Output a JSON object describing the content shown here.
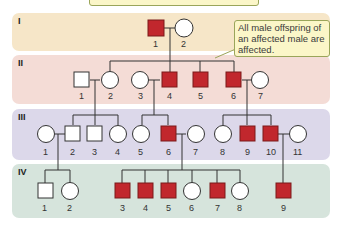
{
  "title_box": {
    "text": ""
  },
  "callout": {
    "text": "All male offspring of an affected male are affected."
  },
  "colors": {
    "affected": "#c1272d",
    "unaffected": "#ffffff",
    "gen1": "#f6e6c8",
    "gen2": "#f4dcd6",
    "gen3": "#dcd8ea",
    "gen4": "#d6e4dc"
  },
  "generations": [
    {
      "label": "I",
      "individuals": [
        {
          "id": "1",
          "sex": "male",
          "affected": true
        },
        {
          "id": "2",
          "sex": "female",
          "affected": false
        }
      ]
    },
    {
      "label": "II",
      "individuals": [
        {
          "id": "1",
          "sex": "male",
          "affected": false
        },
        {
          "id": "2",
          "sex": "female",
          "affected": false
        },
        {
          "id": "3",
          "sex": "female",
          "affected": false
        },
        {
          "id": "4",
          "sex": "male",
          "affected": true
        },
        {
          "id": "5",
          "sex": "male",
          "affected": true
        },
        {
          "id": "6",
          "sex": "male",
          "affected": true
        },
        {
          "id": "7",
          "sex": "female",
          "affected": false
        }
      ]
    },
    {
      "label": "III",
      "individuals": [
        {
          "id": "1",
          "sex": "female",
          "affected": false
        },
        {
          "id": "2",
          "sex": "male",
          "affected": false
        },
        {
          "id": "3",
          "sex": "male",
          "affected": false
        },
        {
          "id": "4",
          "sex": "female",
          "affected": false
        },
        {
          "id": "5",
          "sex": "female",
          "affected": false
        },
        {
          "id": "6",
          "sex": "male",
          "affected": true
        },
        {
          "id": "7",
          "sex": "female",
          "affected": false
        },
        {
          "id": "8",
          "sex": "female",
          "affected": false
        },
        {
          "id": "9",
          "sex": "male",
          "affected": true
        },
        {
          "id": "10",
          "sex": "male",
          "affected": true
        },
        {
          "id": "11",
          "sex": "female",
          "affected": false
        }
      ]
    },
    {
      "label": "IV",
      "individuals": [
        {
          "id": "1",
          "sex": "male",
          "affected": false
        },
        {
          "id": "2",
          "sex": "female",
          "affected": false
        },
        {
          "id": "3",
          "sex": "male",
          "affected": true
        },
        {
          "id": "4",
          "sex": "male",
          "affected": true
        },
        {
          "id": "5",
          "sex": "male",
          "affected": true
        },
        {
          "id": "6",
          "sex": "female",
          "affected": false
        },
        {
          "id": "7",
          "sex": "male",
          "affected": true
        },
        {
          "id": "8",
          "sex": "female",
          "affected": false
        },
        {
          "id": "9",
          "sex": "male",
          "affected": true
        }
      ]
    }
  ]
}
